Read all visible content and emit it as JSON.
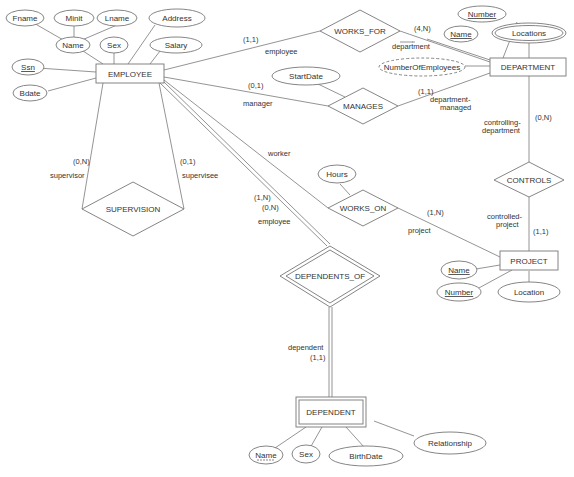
{
  "diagram": {
    "type": "ER diagram",
    "entities": [
      {
        "id": "employee",
        "label": "EMPLOYEE",
        "weak": false
      },
      {
        "id": "department",
        "label": "DEPARTMENT",
        "weak": false
      },
      {
        "id": "project",
        "label": "PROJECT",
        "weak": false
      },
      {
        "id": "dependent",
        "label": "DEPENDENT",
        "weak": true
      }
    ],
    "relationships": [
      {
        "id": "works_for",
        "label": "WORKS_FOR",
        "identifying": false
      },
      {
        "id": "manages",
        "label": "MANAGES",
        "identifying": false
      },
      {
        "id": "works_on",
        "label": "WORKS_ON",
        "identifying": false
      },
      {
        "id": "controls",
        "label": "CONTROLS",
        "identifying": false
      },
      {
        "id": "supervision",
        "label": "SUPERVISION",
        "identifying": false
      },
      {
        "id": "dependents_of",
        "label": "DEPENDENTS_OF",
        "identifying": true
      }
    ],
    "attributes": {
      "fname": "Fname",
      "minit": "Minit",
      "lname": "Lname",
      "name": "Name",
      "sex": "Sex",
      "address": "Address",
      "salary": "Salary",
      "ssn": "Ssn",
      "bdate": "Bdate",
      "dept_number": "Number",
      "dept_name": "Name",
      "locations": "Locations",
      "num_employees": "NumberOfEmployees",
      "startdate": "StartDate",
      "hours": "Hours",
      "proj_name": "Name",
      "proj_number": "Number",
      "proj_location": "Location",
      "dep_name": "Name",
      "dep_sex": "Sex",
      "birthdate": "BirthDate",
      "relationship": "Relationship"
    },
    "roles": {
      "wf_employee": "employee",
      "wf_department": "department",
      "mg_manager": "manager",
      "mg_dept1": "department-",
      "mg_dept2": "managed",
      "wo_worker": "worker",
      "wo_project": "project",
      "ct_dept1": "controlling-",
      "ct_dept2": "department",
      "ct_proj1": "controlled-",
      "ct_proj2": "project",
      "sv_supervisor": "supervisor",
      "sv_supervisee": "supervisee",
      "do_employee": "employee",
      "do_dependent": "dependent"
    },
    "cardinalities": {
      "wf_emp": "(1,1)",
      "wf_dept": "(4,N)",
      "mg_emp": "(0,1)",
      "mg_dept": "(1,1)",
      "wo_emp": "(1,N)",
      "wo_proj": "(1,N)",
      "ct_dept": "(0,N)",
      "ct_proj": "(1,1)",
      "sv_supervisor": "(0,N)",
      "sv_supervisee": "(0,1)",
      "do_emp": "(0,N)",
      "do_dep": "(1,1)"
    }
  }
}
